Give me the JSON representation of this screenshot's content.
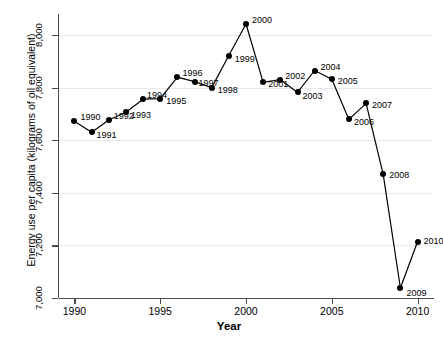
{
  "chart_data": {
    "type": "line",
    "title": "",
    "xlabel": "Year",
    "ylabel": "Energy use per capita (kilograms of oil equivalent)",
    "xlim": [
      1989.1,
      2010.9
    ],
    "ylim": [
      7000,
      8080
    ],
    "xticks": [
      "1990",
      "1995",
      "2000",
      "2005",
      "2010"
    ],
    "xtick_values": [
      1990,
      1995,
      2000,
      2005,
      2010
    ],
    "yticks": [
      "7,000",
      "7,200",
      "7,400",
      "7,600",
      "7,800",
      "8,000"
    ],
    "ytick_values": [
      7000,
      7200,
      7400,
      7600,
      7800,
      8000
    ],
    "grid": true,
    "legend": "none",
    "marker_color": "#000000",
    "line_color": "#000000",
    "grid_color": "#e8e8ea",
    "axis_color": "#4b4b4f",
    "x": [
      1990,
      1991,
      1992,
      1993,
      1994,
      1995,
      1996,
      1997,
      1998,
      1999,
      2000,
      2001,
      2002,
      2003,
      2004,
      2005,
      2006,
      2007,
      2008,
      2009,
      2010
    ],
    "values": [
      7672,
      7630,
      7677,
      7706,
      7756,
      7758,
      7840,
      7823,
      7800,
      7922,
      8042,
      7820,
      7831,
      7782,
      7865,
      7832,
      7679,
      7740,
      7470,
      7038,
      7215
    ],
    "point_labels": [
      {
        "year": 1990,
        "label": "1990",
        "value": 7672,
        "dx": 6,
        "dy": -4
      },
      {
        "year": 1991,
        "label": "1991",
        "value": 7630,
        "dx": 5,
        "dy": 3
      },
      {
        "year": 1992,
        "label": "1992",
        "value": 7677,
        "dx": 5,
        "dy": -4
      },
      {
        "year": 1993,
        "label": "1993",
        "value": 7706,
        "dx": 5,
        "dy": 3
      },
      {
        "year": 1994,
        "label": "1994",
        "value": 7756,
        "dx": 4,
        "dy": -4
      },
      {
        "year": 1995,
        "label": "1995",
        "value": 7758,
        "dx": 6,
        "dy": 2
      },
      {
        "year": 1996,
        "label": "1996",
        "value": 7840,
        "dx": 5,
        "dy": -4
      },
      {
        "year": 1997,
        "label": "1997",
        "value": 7823,
        "dx": 4,
        "dy": 1
      },
      {
        "year": 1998,
        "label": "1998",
        "value": 7800,
        "dx": 6,
        "dy": 2
      },
      {
        "year": 1999,
        "label": "1999",
        "value": 7922,
        "dx": 6,
        "dy": 3
      },
      {
        "year": 2000,
        "label": "2000",
        "value": 8042,
        "dx": 6,
        "dy": -4
      },
      {
        "year": 2001,
        "label": "2001",
        "value": 7820,
        "dx": 5,
        "dy": 2
      },
      {
        "year": 2002,
        "label": "2002",
        "value": 7831,
        "dx": 5,
        "dy": -4
      },
      {
        "year": 2003,
        "label": "2003",
        "value": 7782,
        "dx": 5,
        "dy": 4
      },
      {
        "year": 2004,
        "label": "2004",
        "value": 7865,
        "dx": 6,
        "dy": -4
      },
      {
        "year": 2005,
        "label": "2005",
        "value": 7832,
        "dx": 6,
        "dy": 2
      },
      {
        "year": 2006,
        "label": "2006",
        "value": 7679,
        "dx": 5,
        "dy": 3
      },
      {
        "year": 2007,
        "label": "2007",
        "value": 7740,
        "dx": 6,
        "dy": 2
      },
      {
        "year": 2008,
        "label": "2008",
        "value": 7470,
        "dx": 6,
        "dy": 1
      },
      {
        "year": 2009,
        "label": "2009",
        "value": 7038,
        "dx": 6,
        "dy": 5
      },
      {
        "year": 2010,
        "label": "2010",
        "value": 7215,
        "dx": 6,
        "dy": -1
      }
    ]
  }
}
